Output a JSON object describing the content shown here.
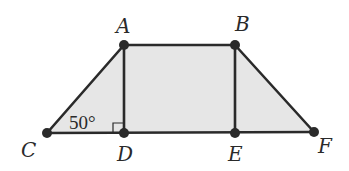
{
  "diagram": {
    "type": "trapezoid",
    "fill_color": "#e6e6e6",
    "stroke_color": "#2a2a2a",
    "points": {
      "A": {
        "label": "A",
        "x": 124,
        "y": 45
      },
      "B": {
        "label": "B",
        "x": 235,
        "y": 45
      },
      "C": {
        "label": "C",
        "x": 47,
        "y": 133
      },
      "D": {
        "label": "D",
        "x": 124,
        "y": 133
      },
      "E": {
        "label": "E",
        "x": 235,
        "y": 133
      },
      "F": {
        "label": "F",
        "x": 314,
        "y": 132
      }
    },
    "angle": {
      "label": "50°",
      "vertex": "C"
    },
    "right_angle_at": "D",
    "segments": [
      "AB",
      "AC",
      "AD",
      "BE",
      "BF",
      "CF"
    ]
  }
}
